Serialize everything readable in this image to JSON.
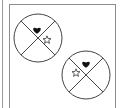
{
  "diagram": {
    "colors": {
      "stroke": "#444444",
      "heart_fill": "#111111",
      "star_stroke": "#333333",
      "panel_border": "#8c8c8c"
    },
    "circles": [
      {
        "id": "circle-1",
        "cx": 38,
        "cy": 38,
        "r": 24,
        "symbols": [
          {
            "type": "heart",
            "quadrant": "top",
            "x": 37,
            "y": 30
          },
          {
            "type": "star",
            "quadrant": "right",
            "x": 47,
            "y": 40
          }
        ]
      },
      {
        "id": "circle-2",
        "cx": 86,
        "cy": 75,
        "r": 24,
        "symbols": [
          {
            "type": "heart",
            "quadrant": "top",
            "x": 86,
            "y": 64
          },
          {
            "type": "star",
            "quadrant": "left",
            "x": 76,
            "y": 73
          }
        ]
      }
    ]
  }
}
